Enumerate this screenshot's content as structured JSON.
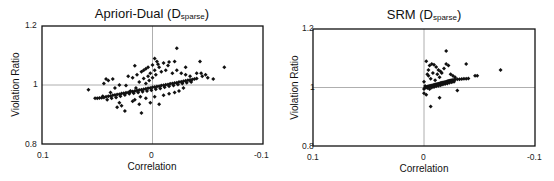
{
  "chart_data": [
    {
      "type": "scatter",
      "title": "Apriori-Dual (Dsparse)",
      "title_main": "Apriori-Dual (D",
      "title_sub": "sparse",
      "title_end": ")",
      "xlabel": "Correlation",
      "ylabel": "Violation Ratio",
      "xlim": [
        0.1,
        -0.1
      ],
      "ylim": [
        0.8,
        1.2
      ],
      "x_ticks": [
        "0.1",
        "0",
        "-0.1"
      ],
      "y_ticks": [
        "1.2",
        "1",
        "0.8"
      ],
      "reference_lines": {
        "x": 0,
        "y": 1
      },
      "grid": false,
      "legend": null,
      "points": [
        [
          0.058,
          0.984
        ],
        [
          0.052,
          0.955
        ],
        [
          0.05,
          0.955
        ],
        [
          0.048,
          0.956
        ],
        [
          0.046,
          0.957
        ],
        [
          0.044,
          0.958
        ],
        [
          0.042,
          0.96
        ],
        [
          0.04,
          0.962
        ],
        [
          0.038,
          0.963
        ],
        [
          0.036,
          0.965
        ],
        [
          0.034,
          0.966
        ],
        [
          0.032,
          0.968
        ],
        [
          0.03,
          0.969
        ],
        [
          0.028,
          0.971
        ],
        [
          0.026,
          0.972
        ],
        [
          0.024,
          0.974
        ],
        [
          0.022,
          0.975
        ],
        [
          0.02,
          0.977
        ],
        [
          0.018,
          0.978
        ],
        [
          0.016,
          0.98
        ],
        [
          0.014,
          0.981
        ],
        [
          0.012,
          0.983
        ],
        [
          0.01,
          0.984
        ],
        [
          0.008,
          0.986
        ],
        [
          0.006,
          0.987
        ],
        [
          0.004,
          0.989
        ],
        [
          0.002,
          0.99
        ],
        [
          0.0,
          0.992
        ],
        [
          -0.002,
          0.993
        ],
        [
          -0.004,
          0.995
        ],
        [
          -0.006,
          0.996
        ],
        [
          -0.008,
          0.998
        ],
        [
          -0.01,
          0.999
        ],
        [
          -0.012,
          1.001
        ],
        [
          -0.014,
          1.002
        ],
        [
          -0.016,
          1.004
        ],
        [
          -0.018,
          1.005
        ],
        [
          -0.02,
          1.007
        ],
        [
          -0.022,
          1.008
        ],
        [
          -0.024,
          1.01
        ],
        [
          -0.026,
          1.011
        ],
        [
          -0.028,
          1.013
        ],
        [
          -0.03,
          1.014
        ],
        [
          -0.032,
          1.016
        ],
        [
          -0.034,
          1.017
        ],
        [
          -0.036,
          1.019
        ],
        [
          -0.038,
          1.02
        ],
        [
          -0.04,
          1.022
        ],
        [
          0.045,
          0.962
        ],
        [
          0.041,
          0.95
        ],
        [
          0.037,
          0.955
        ],
        [
          0.033,
          0.958
        ],
        [
          0.029,
          0.962
        ],
        [
          0.025,
          0.966
        ],
        [
          0.021,
          0.97
        ],
        [
          0.017,
          0.972
        ],
        [
          0.013,
          0.975
        ],
        [
          0.009,
          0.977
        ],
        [
          0.005,
          0.98
        ],
        [
          0.001,
          0.982
        ],
        [
          -0.003,
          0.986
        ],
        [
          -0.007,
          0.988
        ],
        [
          -0.011,
          0.992
        ],
        [
          -0.015,
          0.996
        ],
        [
          -0.019,
          0.998
        ],
        [
          -0.023,
          1.002
        ],
        [
          -0.027,
          1.005
        ],
        [
          -0.031,
          1.008
        ],
        [
          -0.035,
          1.01
        ],
        [
          0.04,
          1.015
        ],
        [
          0.036,
          1.02
        ],
        [
          0.038,
          0.975
        ],
        [
          0.03,
          0.94
        ],
        [
          0.028,
          0.93
        ],
        [
          0.032,
          0.925
        ],
        [
          0.025,
          0.912
        ],
        [
          0.01,
          0.905
        ],
        [
          0.02,
          0.98
        ],
        [
          0.015,
          0.99
        ],
        [
          0.012,
          1.01
        ],
        [
          0.008,
          1.022
        ],
        [
          0.004,
          1.03
        ],
        [
          0.002,
          1.04
        ],
        [
          -0.002,
          1.05
        ],
        [
          -0.006,
          1.06
        ],
        [
          0.018,
          1.025
        ],
        [
          0.022,
          1.03
        ],
        [
          0.014,
          1.035
        ],
        [
          0.01,
          1.045
        ],
        [
          0.006,
          1.055
        ],
        [
          0.016,
          1.065
        ],
        [
          -0.005,
          1.07
        ],
        [
          -0.01,
          1.075
        ],
        [
          -0.015,
          1.078
        ],
        [
          -0.02,
          1.08
        ],
        [
          -0.014,
          1.066
        ],
        [
          -0.022,
          1.05
        ],
        [
          -0.026,
          1.04
        ],
        [
          -0.03,
          1.035
        ],
        [
          -0.018,
          1.04
        ],
        [
          -0.008,
          1.045
        ],
        [
          -0.003,
          1.035
        ],
        [
          0.0,
          1.025
        ],
        [
          0.003,
          1.015
        ],
        [
          0.006,
          1.005
        ],
        [
          0.011,
          0.96
        ],
        [
          0.016,
          0.95
        ],
        [
          0.006,
          0.955
        ],
        [
          -0.002,
          0.96
        ],
        [
          -0.01,
          0.965
        ],
        [
          -0.015,
          0.97
        ],
        [
          -0.02,
          0.975
        ],
        [
          -0.024,
          0.98
        ],
        [
          0.002,
          0.94
        ],
        [
          -0.006,
          0.935
        ],
        [
          0.012,
          0.935
        ],
        [
          0.018,
          0.945
        ],
        [
          -0.028,
          0.99
        ],
        [
          -0.034,
          1.03
        ],
        [
          -0.04,
          1.04
        ],
        [
          -0.044,
          1.04
        ],
        [
          -0.048,
          1.035
        ],
        [
          -0.022,
          1.125
        ],
        [
          -0.043,
          1.08
        ],
        [
          -0.065,
          1.06
        ],
        [
          -0.05,
          1.025
        ],
        [
          -0.055,
          1.02
        ],
        [
          -0.045,
          1.03
        ],
        [
          0.042,
          1.02
        ],
        [
          0.044,
          1.005
        ],
        [
          0.03,
          1.0
        ],
        [
          0.024,
          0.998
        ],
        [
          0.034,
          0.99
        ],
        [
          0.008,
          1.05
        ],
        [
          0.004,
          1.06
        ],
        [
          0.0,
          1.068
        ],
        [
          -0.004,
          1.08
        ],
        [
          -0.002,
          1.09
        ],
        [
          -0.03,
          1.06
        ],
        [
          -0.034,
          1.015
        ],
        [
          -0.012,
          1.05
        ]
      ]
    },
    {
      "type": "scatter",
      "title": "SRM (Dsparse)",
      "title_main": "SRM (D",
      "title_sub": "sparse",
      "title_end": ")",
      "xlabel": "Correlation",
      "ylabel": "Violation Ratio",
      "xlim": [
        0.1,
        -0.1
      ],
      "ylim": [
        0.8,
        1.2
      ],
      "x_ticks": [
        "0.1",
        "0",
        "-0.1"
      ],
      "y_ticks": [
        "1.2",
        "1",
        "0.8"
      ],
      "reference_lines": {
        "x": 0,
        "y": 1
      },
      "grid": false,
      "legend": null,
      "points": [
        [
          0.0,
          0.98
        ],
        [
          0.0,
          0.995
        ],
        [
          -0.001,
          1.0
        ],
        [
          -0.002,
          1.002
        ],
        [
          -0.003,
          1.003
        ],
        [
          -0.004,
          1.004
        ],
        [
          -0.005,
          1.005
        ],
        [
          -0.006,
          1.006
        ],
        [
          -0.007,
          1.007
        ],
        [
          -0.008,
          1.008
        ],
        [
          -0.009,
          1.009
        ],
        [
          -0.01,
          1.01
        ],
        [
          -0.011,
          1.011
        ],
        [
          -0.012,
          1.012
        ],
        [
          -0.013,
          1.013
        ],
        [
          -0.014,
          1.014
        ],
        [
          -0.015,
          1.015
        ],
        [
          -0.016,
          1.016
        ],
        [
          -0.017,
          1.017
        ],
        [
          -0.018,
          1.018
        ],
        [
          -0.019,
          1.019
        ],
        [
          -0.02,
          1.02
        ],
        [
          -0.021,
          1.021
        ],
        [
          -0.022,
          1.022
        ],
        [
          -0.023,
          1.023
        ],
        [
          -0.024,
          1.024
        ],
        [
          -0.025,
          1.025
        ],
        [
          -0.026,
          1.026
        ],
        [
          -0.027,
          1.026
        ],
        [
          -0.028,
          1.027
        ],
        [
          -0.03,
          1.028
        ],
        [
          -0.032,
          1.028
        ],
        [
          -0.034,
          1.029
        ],
        [
          -0.036,
          1.03
        ],
        [
          -0.038,
          1.03
        ],
        [
          -0.04,
          1.031
        ],
        [
          -0.001,
          1.005
        ],
        [
          -0.003,
          0.998
        ],
        [
          -0.005,
          0.995
        ],
        [
          -0.007,
          1.0
        ],
        [
          -0.009,
          1.002
        ],
        [
          -0.011,
          1.004
        ],
        [
          -0.013,
          1.006
        ],
        [
          -0.015,
          1.008
        ],
        [
          -0.017,
          1.01
        ],
        [
          -0.019,
          1.012
        ],
        [
          -0.021,
          1.014
        ],
        [
          -0.023,
          1.016
        ],
        [
          -0.025,
          1.018
        ],
        [
          -0.027,
          1.02
        ],
        [
          -0.002,
          1.09
        ],
        [
          -0.005,
          1.075
        ],
        [
          -0.007,
          1.08
        ],
        [
          -0.009,
          1.078
        ],
        [
          -0.011,
          1.07
        ],
        [
          -0.013,
          1.06
        ],
        [
          -0.015,
          1.055
        ],
        [
          -0.02,
          1.08
        ],
        [
          -0.022,
          1.075
        ],
        [
          -0.018,
          1.065
        ],
        [
          -0.016,
          1.05
        ],
        [
          -0.012,
          1.045
        ],
        [
          -0.008,
          1.05
        ],
        [
          -0.004,
          1.04
        ],
        [
          -0.006,
          1.03
        ],
        [
          -0.01,
          1.025
        ],
        [
          -0.014,
          1.035
        ],
        [
          -0.024,
          1.045
        ],
        [
          -0.026,
          1.04
        ],
        [
          -0.028,
          1.035
        ],
        [
          -0.02,
          1.125
        ],
        [
          -0.038,
          1.08
        ],
        [
          -0.046,
          1.04
        ],
        [
          -0.048,
          1.04
        ],
        [
          -0.069,
          1.06
        ],
        [
          -0.03,
          0.99
        ],
        [
          -0.014,
          0.965
        ],
        [
          -0.006,
          0.935
        ],
        [
          -0.002,
          0.975
        ],
        [
          0.0,
          1.02
        ],
        [
          -0.003,
          1.045
        ],
        [
          -0.004,
          1.06
        ]
      ]
    }
  ],
  "panels": [
    {
      "title_main": "Apriori-Dual (D",
      "title_sub": "sparse",
      "title_end": ")"
    },
    {
      "title_main": "SRM (D",
      "title_sub": "sparse",
      "title_end": ")"
    }
  ]
}
